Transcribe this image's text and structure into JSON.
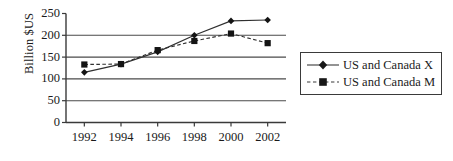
{
  "chart_data": {
    "type": "line",
    "title": "",
    "xlabel": "",
    "ylabel": "Billion $US",
    "x": [
      1992,
      1994,
      1996,
      1998,
      2000,
      2002
    ],
    "xtick_labels": [
      "1992",
      "1994",
      "1996",
      "1998",
      "2000",
      "2002"
    ],
    "ytick_labels": [
      "0",
      "50",
      "100",
      "150",
      "200",
      "250"
    ],
    "yticks": [
      0,
      50,
      100,
      150,
      200,
      250
    ],
    "xlim": [
      1991,
      2003
    ],
    "ylim": [
      0,
      250
    ],
    "grid": "horizontal",
    "legend_position": "right",
    "series": [
      {
        "name": "US and Canada X",
        "marker": "diamond",
        "line_style": "solid",
        "color": "#303030",
        "values": [
          115,
          134,
          162,
          200,
          233,
          235
        ]
      },
      {
        "name": "US and Canada M",
        "marker": "square",
        "line_style": "dashed",
        "color": "#303030",
        "values": [
          133,
          134,
          166,
          187,
          204,
          182
        ]
      }
    ]
  },
  "legend": {
    "items": [
      {
        "label": "US and Canada X"
      },
      {
        "label": "US and Canada M"
      }
    ]
  },
  "axis": {
    "y_title": "Billion $US"
  }
}
